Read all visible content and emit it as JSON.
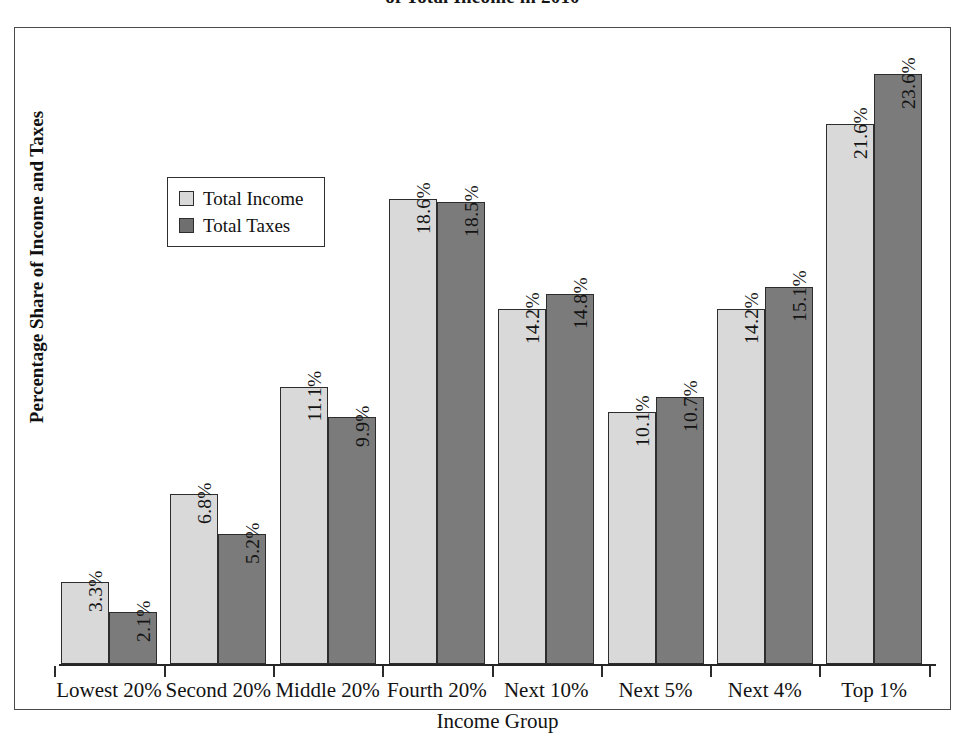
{
  "chart_data": {
    "type": "bar",
    "title": "of Total Income in 2010",
    "xlabel": "Income Group",
    "ylabel": "Percentage Share of Income and Taxes",
    "categories": [
      "Lowest 20%",
      "Second 20%",
      "Middle 20%",
      "Fourth 20%",
      "Next 10%",
      "Next 5%",
      "Next 4%",
      "Top 1%"
    ],
    "series": [
      {
        "name": "Total Income",
        "color": "#d9d9d9",
        "values": [
          3.3,
          6.8,
          11.1,
          18.6,
          14.2,
          10.1,
          14.2,
          21.6
        ],
        "labels": [
          "3.3%",
          "6.8%",
          "11.1%",
          "18.6%",
          "14.2%",
          "10.1%",
          "14.2%",
          "21.6%"
        ]
      },
      {
        "name": "Total Taxes",
        "color": "#7b7b7b",
        "values": [
          2.1,
          5.2,
          9.9,
          18.5,
          14.8,
          10.7,
          15.1,
          23.6
        ],
        "labels": [
          "2.1%",
          "5.2%",
          "9.9%",
          "18.5%",
          "14.8%",
          "10.7%",
          "15.1%",
          "23.6%"
        ]
      }
    ],
    "ylim": [
      0,
      23.6
    ],
    "grid": false,
    "legend_position": "upper-left-inside",
    "value_label_orientation": "vertical-inside-bar"
  },
  "legend": {
    "items": [
      {
        "label": "Total Income",
        "swatch": "income"
      },
      {
        "label": "Total Taxes",
        "swatch": "taxes"
      }
    ]
  }
}
